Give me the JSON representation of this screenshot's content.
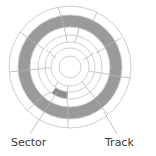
{
  "diagram": {
    "labels": {
      "sector": "Sector",
      "track": "Track"
    },
    "colors": {
      "line": "#c8c8c8",
      "track_fill": "#9a9a9a",
      "sector_fill": "#8c8c8c",
      "background": "#ffffff",
      "text": "#3a3a3a"
    },
    "center": [
      70,
      67
    ],
    "ring_radii": [
      61,
      52,
      40,
      32,
      25,
      19,
      11
    ],
    "highlighted_track": {
      "inner_radius": 40,
      "outer_radius": 52
    },
    "highlighted_sector": {
      "inner_radius": 25,
      "outer_radius": 32,
      "start_deg": 95,
      "end_deg": 125
    }
  }
}
